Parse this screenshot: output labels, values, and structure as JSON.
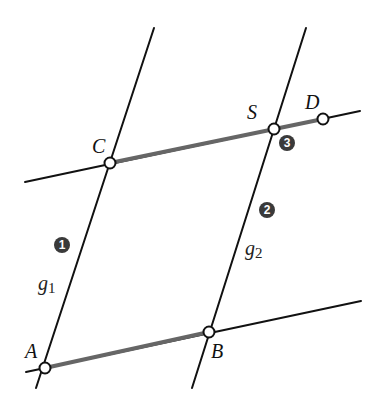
{
  "diagram": {
    "title": "",
    "colors": {
      "line": "#111111",
      "highlight_segment": "#666666",
      "point_fill": "#ffffff",
      "badge": "#3a3a3a"
    },
    "points": {
      "A": {
        "label": "A",
        "x": 45,
        "y": 368
      },
      "B": {
        "label": "B",
        "x": 209,
        "y": 332
      },
      "C": {
        "label": "C",
        "x": 110,
        "y": 163
      },
      "S": {
        "label": "S",
        "x": 274,
        "y": 129
      },
      "D": {
        "label": "D",
        "x": 323,
        "y": 119
      }
    },
    "lines": {
      "g1": {
        "name": "g",
        "subscript": "1"
      },
      "g2": {
        "name": "g",
        "subscript": "2"
      }
    },
    "steps": [
      {
        "number": "1",
        "label": "1"
      },
      {
        "number": "2",
        "label": "2"
      },
      {
        "number": "3",
        "label": "3"
      }
    ],
    "highlighted_segments": [
      "AB",
      "CD"
    ]
  }
}
